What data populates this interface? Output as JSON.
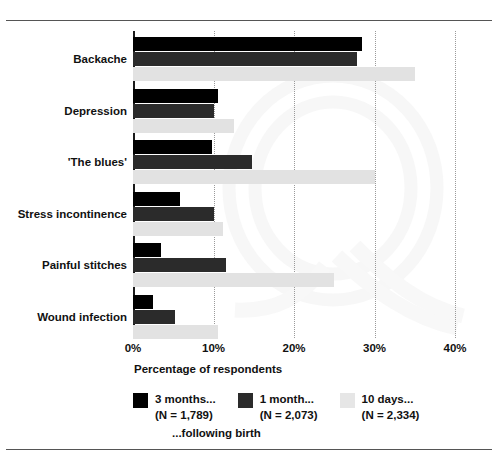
{
  "chart_data": {
    "type": "bar",
    "orientation": "horizontal",
    "title": "",
    "xlabel": "Percentage of respondents",
    "ylabel": "",
    "xlim": [
      0,
      40
    ],
    "xticks": [
      "0%",
      "10%",
      "20%",
      "30%",
      "40%"
    ],
    "xtick_values": [
      0,
      10,
      20,
      30,
      40
    ],
    "grid": "vertical dotted gridlines at 10%, 20%, 30%, 40%",
    "legend_position": "below axis, horizontal",
    "categories": [
      "Backache",
      "Depression",
      "'The blues'",
      "Stress incontinence",
      "Painful stitches",
      "Wound infection"
    ],
    "series": [
      {
        "name": "3 months...",
        "n_label": "(N = 1,789)",
        "color": "#000000",
        "values": [
          28.5,
          10.5,
          9.8,
          5.8,
          3.5,
          2.5
        ]
      },
      {
        "name": "1 month...",
        "n_label": "(N = 2,073)",
        "color": "#2b2b2b",
        "values": [
          27.8,
          10.0,
          14.8,
          10.0,
          11.5,
          5.2
        ]
      },
      {
        "name": "10 days...",
        "n_label": "(N = 2,334)",
        "color": "#e2e2e2",
        "values": [
          35.0,
          12.5,
          30.0,
          11.2,
          25.0,
          10.5
        ]
      }
    ],
    "legend_suffix_note": "...following birth",
    "watermark": "Q"
  },
  "axis": {
    "xlabel": "Percentage of respondents"
  },
  "footnote": {
    "text": "...following birth"
  }
}
